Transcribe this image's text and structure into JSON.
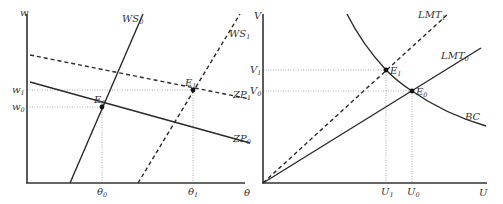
{
  "left_panel": {
    "y_axis_label": "w",
    "x_axis_label": "θ",
    "curves": {
      "ws0": {
        "label": "WS",
        "sub": "0",
        "style": "solid"
      },
      "ws1": {
        "label": "WS",
        "sub": "1",
        "style": "dashed"
      },
      "zp0": {
        "label": "ZP",
        "sub": "0",
        "style": "solid"
      },
      "zp1": {
        "label": "ZP",
        "sub": "1",
        "style": "dashed"
      }
    },
    "points": {
      "e0": {
        "label": "E",
        "sub": "0"
      },
      "e1": {
        "label": "E",
        "sub": "1"
      }
    },
    "y_ticks": {
      "w1": {
        "label": "w",
        "sub": "1"
      },
      "w0": {
        "label": "w",
        "sub": "0"
      }
    },
    "x_ticks": {
      "theta0": {
        "label": "θ",
        "sub": "0"
      },
      "theta1": {
        "label": "θ",
        "sub": "1"
      }
    }
  },
  "right_panel": {
    "y_axis_label": "V",
    "x_axis_label": "U",
    "curves": {
      "lmt0": {
        "label": "LMT",
        "sub": "0",
        "style": "solid"
      },
      "lmt1": {
        "label": "LMT",
        "sub": "1",
        "style": "dashed"
      },
      "bc": {
        "label": "BC",
        "style": "solid"
      }
    },
    "points": {
      "e0": {
        "label": "E",
        "sub": "0"
      },
      "e1": {
        "label": "E",
        "sub": "1"
      }
    },
    "y_ticks": {
      "v1": {
        "label": "V",
        "sub": "1"
      },
      "v0": {
        "label": "V",
        "sub": "0"
      }
    },
    "x_ticks": {
      "u1": {
        "label": "U",
        "sub": "1"
      },
      "u0": {
        "label": "U",
        "sub": "0"
      }
    }
  }
}
